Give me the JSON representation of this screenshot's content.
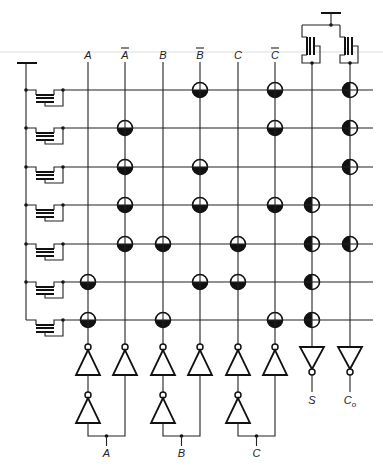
{
  "diagram": {
    "colors": {
      "ink": "#111111",
      "background": "#ffffff"
    },
    "input_columns": [
      {
        "id": "A",
        "label": "A",
        "overbar": false,
        "x": 88
      },
      {
        "id": "Abar",
        "label": "A",
        "overbar": true,
        "x": 125
      },
      {
        "id": "B",
        "label": "B",
        "overbar": false,
        "x": 163
      },
      {
        "id": "Bbar",
        "label": "B",
        "overbar": true,
        "x": 200
      },
      {
        "id": "C",
        "label": "C",
        "overbar": false,
        "x": 238
      },
      {
        "id": "Cbar",
        "label": "C",
        "overbar": true,
        "x": 275
      }
    ],
    "output_columns": [
      {
        "id": "S",
        "label": "S",
        "x": 312
      },
      {
        "id": "Co",
        "label": "C",
        "subscript": "o",
        "x": 350
      }
    ],
    "rows_y": [
      90,
      128,
      167,
      205,
      244,
      282,
      320
    ],
    "and_plane_nodes": [
      {
        "row": 0,
        "col": "Bbar"
      },
      {
        "row": 0,
        "col": "Cbar"
      },
      {
        "row": 1,
        "col": "Abar"
      },
      {
        "row": 1,
        "col": "Cbar"
      },
      {
        "row": 2,
        "col": "Abar"
      },
      {
        "row": 2,
        "col": "Bbar"
      },
      {
        "row": 3,
        "col": "Abar"
      },
      {
        "row": 3,
        "col": "Bbar"
      },
      {
        "row": 3,
        "col": "Cbar"
      },
      {
        "row": 4,
        "col": "Abar"
      },
      {
        "row": 4,
        "col": "B"
      },
      {
        "row": 4,
        "col": "C"
      },
      {
        "row": 5,
        "col": "A"
      },
      {
        "row": 5,
        "col": "Bbar"
      },
      {
        "row": 5,
        "col": "C"
      },
      {
        "row": 6,
        "col": "A"
      },
      {
        "row": 6,
        "col": "B"
      },
      {
        "row": 6,
        "col": "Cbar"
      }
    ],
    "or_plane_nodes": [
      {
        "row": 0,
        "col": "Co"
      },
      {
        "row": 1,
        "col": "Co"
      },
      {
        "row": 2,
        "col": "Co"
      },
      {
        "row": 3,
        "col": "S"
      },
      {
        "row": 4,
        "col": "S"
      },
      {
        "row": 4,
        "col": "Co"
      },
      {
        "row": 5,
        "col": "S"
      },
      {
        "row": 6,
        "col": "S"
      }
    ],
    "input_buses": [
      {
        "label": "A",
        "true_x": 88,
        "comp_x": 125
      },
      {
        "label": "B",
        "true_x": 163,
        "comp_x": 200
      },
      {
        "label": "C",
        "true_x": 238,
        "comp_x": 275
      }
    ],
    "output_labels": {
      "S": "S",
      "Co": "C",
      "Co_sub": "o"
    }
  }
}
